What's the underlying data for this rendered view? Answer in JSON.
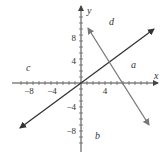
{
  "diagram": {
    "axes": {
      "x_label": "x",
      "y_label": "y",
      "x_ticks": [
        {
          "value": -8,
          "label": "−8"
        },
        {
          "value": -4,
          "label": "−4"
        },
        {
          "value": 4,
          "label": "4"
        }
      ],
      "y_ticks": [
        {
          "value": 8,
          "label": "8"
        },
        {
          "value": 4,
          "label": "4"
        },
        {
          "value": -4,
          "label": "−4"
        },
        {
          "value": -8,
          "label": "−8"
        }
      ],
      "tick_spacing_units": 2,
      "range": [
        -23,
        23
      ]
    },
    "lines": [
      {
        "name": "line-through-origin",
        "color": "#333333",
        "description": "increasing line through origin"
      },
      {
        "name": "decreasing-line",
        "color": "#777777",
        "description": "decreasing line crossing x-axis near 6.7"
      }
    ],
    "region_labels": {
      "a": "a",
      "b": "b",
      "c": "c",
      "d": "d"
    },
    "colors": {
      "axis": "#444444",
      "line1": "#333333",
      "line2": "#777777"
    }
  }
}
